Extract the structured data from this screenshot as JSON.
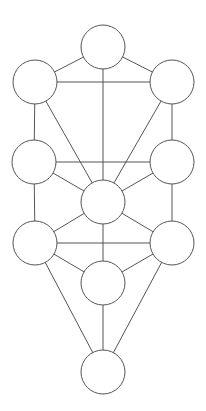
{
  "diagram": {
    "type": "tree-of-life",
    "background": "#ffffff",
    "stroke_color": "#555555",
    "node_radius": 22,
    "nodes": [
      {
        "id": "n1",
        "x": 103,
        "y": 47
      },
      {
        "id": "n2",
        "x": 172,
        "y": 82
      },
      {
        "id": "n3",
        "x": 35,
        "y": 82
      },
      {
        "id": "n4",
        "x": 172,
        "y": 162
      },
      {
        "id": "n5",
        "x": 34,
        "y": 162
      },
      {
        "id": "n6",
        "x": 103,
        "y": 202
      },
      {
        "id": "n7",
        "x": 172,
        "y": 243
      },
      {
        "id": "n8",
        "x": 35,
        "y": 243
      },
      {
        "id": "n9",
        "x": 103,
        "y": 283
      },
      {
        "id": "n10",
        "x": 103,
        "y": 372
      }
    ],
    "edges": [
      [
        "n1",
        "n2"
      ],
      [
        "n1",
        "n3"
      ],
      [
        "n1",
        "n6"
      ],
      [
        "n2",
        "n3"
      ],
      [
        "n2",
        "n4"
      ],
      [
        "n2",
        "n6"
      ],
      [
        "n3",
        "n5"
      ],
      [
        "n3",
        "n6"
      ],
      [
        "n4",
        "n5"
      ],
      [
        "n4",
        "n6"
      ],
      [
        "n4",
        "n7"
      ],
      [
        "n5",
        "n6"
      ],
      [
        "n5",
        "n8"
      ],
      [
        "n6",
        "n7"
      ],
      [
        "n6",
        "n8"
      ],
      [
        "n6",
        "n9"
      ],
      [
        "n7",
        "n8"
      ],
      [
        "n7",
        "n9"
      ],
      [
        "n7",
        "n10"
      ],
      [
        "n8",
        "n9"
      ],
      [
        "n8",
        "n10"
      ],
      [
        "n9",
        "n10"
      ]
    ]
  }
}
